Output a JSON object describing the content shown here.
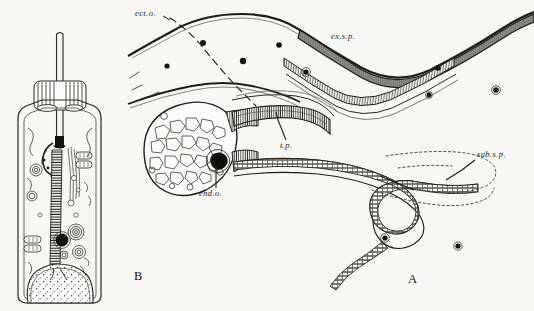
{
  "plate": {
    "width": 534,
    "height": 311,
    "background_color": "#f8f7f4",
    "ink_color": "#1c1a17",
    "caption_style": "italic abbreviated anatomical labels"
  },
  "figures": [
    {
      "id": "figure-b",
      "label": "B",
      "label_x": 134,
      "label_y": 271,
      "description": "Longitudinal section of a single ciliated sensory cell with apical spine, collar, striated rootlet and basal nucleus"
    },
    {
      "id": "figure-a",
      "label": "A",
      "label_x": 408,
      "label_y": 274,
      "description": "Low-power section through the epidermal sense organ showing ectodermal layer, external and subepidermal sensory papillae, terminal plug and end organ"
    }
  ],
  "labels": [
    {
      "id": "ect-o",
      "text": "ect.o.",
      "x": 135,
      "y": 11,
      "leader": "dashed",
      "target": "ectodermal organ boundary"
    },
    {
      "id": "ex-s-p",
      "text": "ex.s.p.",
      "x": 331,
      "y": 34,
      "leader": "none",
      "target": "external sense papilla"
    },
    {
      "id": "t-p",
      "text": "t.p.",
      "x": 280,
      "y": 143,
      "leader": "solid",
      "target": "terminal plug"
    },
    {
      "id": "end-o",
      "text": "end.o.",
      "x": 199,
      "y": 190,
      "leader": "solid",
      "target": "end organ dark body"
    },
    {
      "id": "sub-s-p",
      "text": "sub.s.p.",
      "x": 477,
      "y": 152,
      "leader": "solid",
      "target": "subepidermal sense papilla outline"
    }
  ],
  "figure_b_parts": [
    {
      "name": "apical-spine",
      "note": "long slender rod projecting above the cell"
    },
    {
      "name": "collar",
      "note": "ring of vertical striations below the spine base"
    },
    {
      "name": "cell-outline",
      "note": "elongate columnar cell wall"
    },
    {
      "name": "striated-rootlet",
      "note": "ladder-like banded fibre down the cell axis"
    },
    {
      "name": "basal-body",
      "note": "dark granule at the spine base"
    },
    {
      "name": "mitochondria",
      "note": "elongate rod-shaped bodies flanking the rootlet"
    },
    {
      "name": "golgi-whorls",
      "note": "concentric spiral bodies in mid cell"
    },
    {
      "name": "dark-granule",
      "note": "solid black inclusion"
    },
    {
      "name": "vesicles",
      "note": "small open circles scattered in cytoplasm"
    },
    {
      "name": "nucleus",
      "note": "large stippled basal nucleus"
    }
  ],
  "figure_a_parts": [
    {
      "name": "ectoderm-upper-border",
      "note": "undulating upper cuticular line"
    },
    {
      "name": "ectoderm-lower-border",
      "note": "second undulating line below"
    },
    {
      "name": "nuclei-dots",
      "note": "scattered solid round nuclei in the matrix"
    },
    {
      "name": "external-sense-papilla",
      "note": "thick hatched V-shaped epithelial band upper right"
    },
    {
      "name": "sensory-bulb",
      "note": "large oval body filled with polygonal vacuoles"
    },
    {
      "name": "terminal-plug",
      "note": "hatched duct running right from the bulb"
    },
    {
      "name": "end-organ",
      "note": "small dark spot at the bulb neck"
    },
    {
      "name": "looping-duct",
      "note": "hatched tube looping at the right and tapering below"
    },
    {
      "name": "subepidermal-papilla-outline",
      "note": "dotted outline region to the right"
    }
  ]
}
